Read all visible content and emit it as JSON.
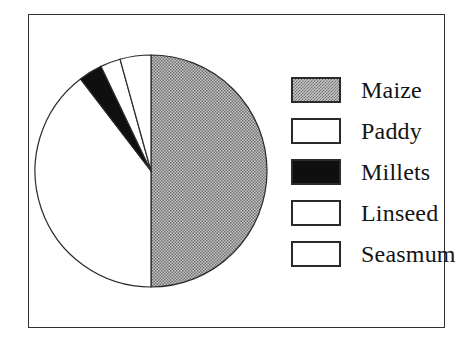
{
  "colors": {
    "page_bg": "#ffffff",
    "frame_border": "#303030",
    "pattern_dark": "#707070",
    "pattern_light": "#c6c6c6",
    "stroke": "#2b2b2b",
    "slice_black": "#0f0f0f",
    "slice_white": "#ffffff",
    "swatch_border": "#2a2a2a",
    "label": "#141414"
  },
  "chart_data": {
    "type": "pie",
    "title": "",
    "categories": [
      "Maize",
      "Paddy",
      "Millets",
      "Linseed",
      "Seasmum"
    ],
    "values": [
      50,
      39.6,
      3.3,
      2.8,
      4.3
    ],
    "unit": "percent",
    "start_angle_deg": 0,
    "direction": "clockwise",
    "slice_fills": [
      "halftone",
      "white",
      "black",
      "white",
      "white"
    ],
    "legend_position": "right",
    "grid": false
  }
}
